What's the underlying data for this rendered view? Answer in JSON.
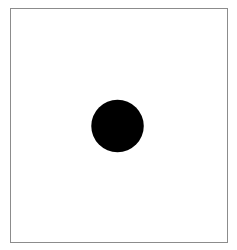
{
  "figure": {
    "title": "",
    "canvas": {
      "width": 237,
      "height": 250,
      "background_color": "#ffffff"
    },
    "frame": {
      "visible": true,
      "x": 10,
      "y": 8,
      "width": 218,
      "height": 235,
      "stroke_color": "#8c8c8c",
      "stroke_width": 1,
      "fill_color": "#ffffff"
    }
  },
  "chart_data": {
    "type": "scatter",
    "title": "",
    "subtitle": "",
    "xlabel": "",
    "ylabel": "",
    "grid": false,
    "legend": null,
    "axis_visible": false,
    "tick_labels_x": [],
    "tick_labels_y": [],
    "xlim": [
      0,
      218
    ],
    "ylim": [
      0,
      235
    ],
    "series": [
      {
        "name": "marker",
        "marker_shape": "circle",
        "marker_color": "#000000",
        "marker_edge_color": "#000000",
        "marker_diameter": 53,
        "points": [
          {
            "x": 107.5,
            "y": 118
          }
        ]
      }
    ],
    "annotations": []
  },
  "shapes": [
    {
      "name": "black-circle",
      "kind": "circle",
      "center_x": 107.5,
      "center_y": 118,
      "radius": 26.5,
      "fill": "#000000",
      "stroke": "none"
    }
  ]
}
